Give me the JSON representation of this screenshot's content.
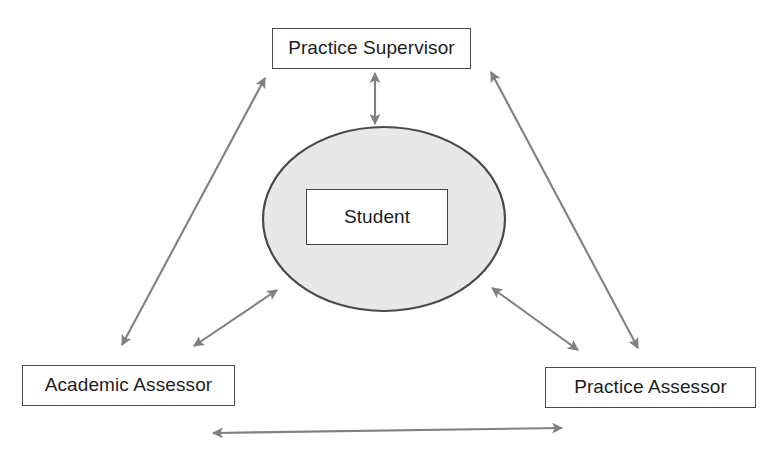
{
  "diagram": {
    "background_color": "#ffffff",
    "nodes": {
      "practice_supervisor": {
        "label": "Practice Supervisor",
        "shape": "rectangle",
        "fill_color": "#ffffff",
        "border_color": "#4a4a4a"
      },
      "student": {
        "label": "Student",
        "shape": "rectangle",
        "fill_color": "#ffffff",
        "border_color": "#444444"
      },
      "academic_assessor": {
        "label": "Academic Assessor",
        "shape": "rectangle",
        "fill_color": "#ffffff",
        "border_color": "#4a4a4a"
      },
      "practice_assessor": {
        "label": "Practice Assessor",
        "shape": "rectangle",
        "fill_color": "#ffffff",
        "border_color": "#4a4a4a"
      }
    },
    "ellipse": {
      "name": "student-context-ellipse",
      "fill_color": "#e8e8e8",
      "border_color": "#4a4a4a"
    },
    "connectors": [
      {
        "id": "supervisor-student",
        "from": "practice_supervisor",
        "to": "student",
        "direction": "bidirectional",
        "color": "#808080"
      },
      {
        "id": "academic-supervisor",
        "from": "academic_assessor",
        "to": "practice_supervisor",
        "direction": "bidirectional",
        "color": "#808080"
      },
      {
        "id": "practice-assessor-supervisor",
        "from": "practice_assessor",
        "to": "practice_supervisor",
        "direction": "bidirectional",
        "color": "#808080"
      },
      {
        "id": "academic-student",
        "from": "academic_assessor",
        "to": "student",
        "direction": "bidirectional",
        "color": "#808080"
      },
      {
        "id": "practice-assessor-student",
        "from": "practice_assessor",
        "to": "student",
        "direction": "bidirectional",
        "color": "#808080"
      },
      {
        "id": "academic-practice-assessor",
        "from": "academic_assessor",
        "to": "practice_assessor",
        "direction": "bidirectional",
        "color": "#808080"
      }
    ]
  }
}
